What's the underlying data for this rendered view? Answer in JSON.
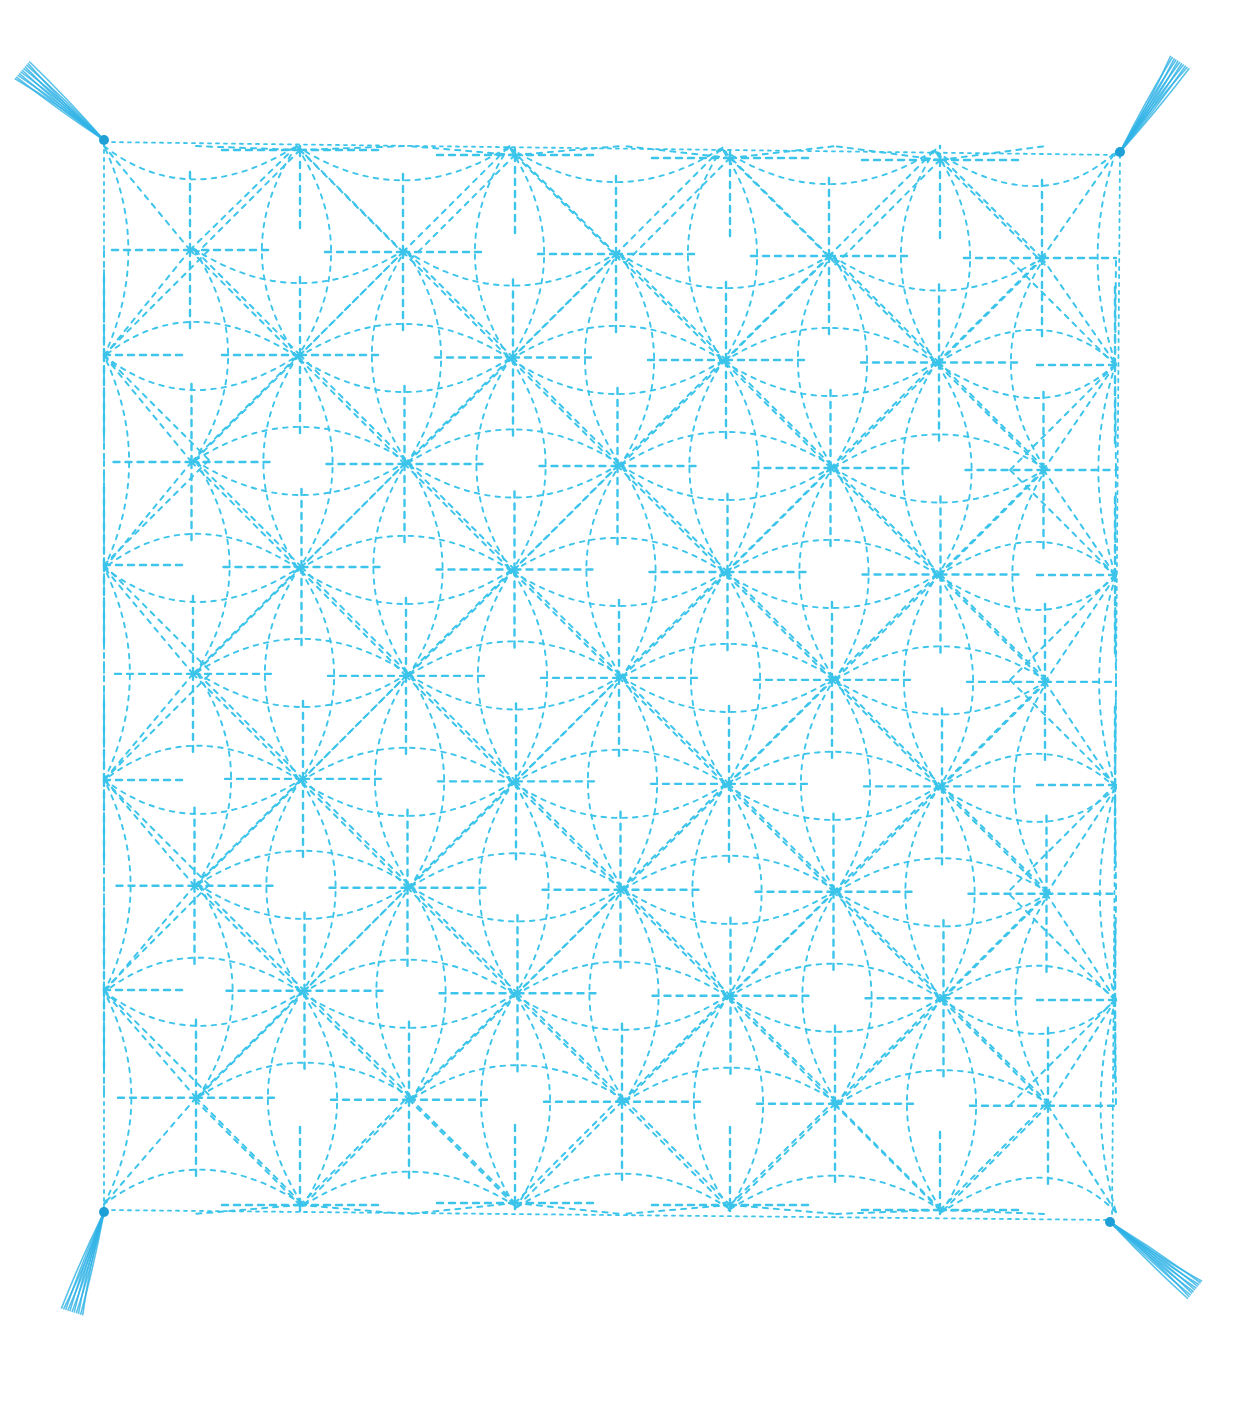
{
  "image": {
    "subject": "Sashiko embroidery sampler with star/hemp-leaf pattern",
    "background_color": "#ffffff",
    "thread_color": "#3cc4ea",
    "tassel_color": "#2fb3e6"
  },
  "fabric_square": {
    "corners": {
      "top_left": [
        104,
        142
      ],
      "top_right": [
        1120,
        155
      ],
      "bottom_right": [
        1112,
        1220
      ],
      "bottom_left": [
        104,
        1210
      ]
    }
  },
  "pattern": {
    "name": "asanoha-star",
    "spacing": 213,
    "primary_centers_origin": [
      190,
      250
    ],
    "primary_cols": 5,
    "primary_rows": 5,
    "secondary_centers_origin": [
      300,
      355
    ],
    "secondary_cols": 4,
    "secondary_rows": 4,
    "edge_half_centers_top": [
      [
        300,
        150
      ],
      [
        515,
        155
      ],
      [
        730,
        158
      ],
      [
        940,
        160
      ]
    ],
    "edge_half_centers_bottom": [
      [
        300,
        1205
      ],
      [
        515,
        1203
      ],
      [
        730,
        1205
      ],
      [
        940,
        1210
      ]
    ],
    "edge_half_centers_left": [
      [
        104,
        355
      ],
      [
        104,
        565
      ],
      [
        104,
        780
      ],
      [
        104,
        990
      ]
    ],
    "edge_half_centers_right": [
      [
        1115,
        365
      ],
      [
        1115,
        575
      ],
      [
        1115,
        785
      ],
      [
        1115,
        1000
      ]
    ]
  },
  "tassels": [
    {
      "name": "top-left",
      "anchor": [
        104,
        140
      ],
      "tip": [
        22,
        70
      ]
    },
    {
      "name": "top-right",
      "anchor": [
        1120,
        152
      ],
      "tip": [
        1180,
        62
      ]
    },
    {
      "name": "bottom-left",
      "anchor": [
        104,
        1212
      ],
      "tip": [
        72,
        1312
      ]
    },
    {
      "name": "bottom-right",
      "anchor": [
        1110,
        1222
      ],
      "tip": [
        1195,
        1290
      ]
    }
  ]
}
